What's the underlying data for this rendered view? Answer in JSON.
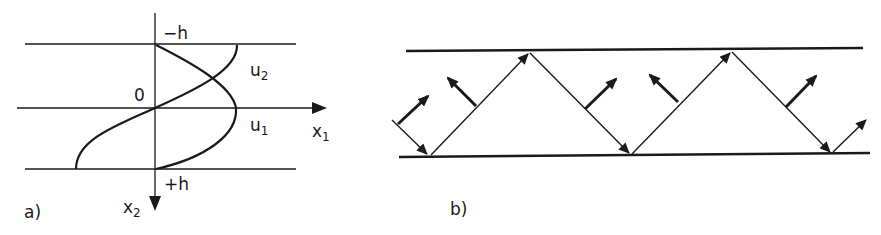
{
  "panel_a": {
    "label": "a)",
    "axis_x_label": "x",
    "axis_x_sub": "1",
    "axis_y_label": "x",
    "axis_y_sub": "2",
    "top_boundary_label": "−h",
    "bottom_boundary_label": "+h",
    "origin_label": "0",
    "curve_u1_label": "u",
    "curve_u1_sub": "1",
    "curve_u2_label": "u",
    "curve_u2_sub": "2"
  },
  "panel_b": {
    "label": "b)"
  },
  "colors": {
    "ink": "#1a1a1a",
    "background": "#ffffff"
  }
}
